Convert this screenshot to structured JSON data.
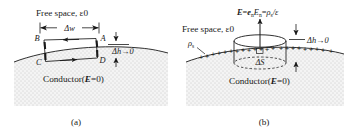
{
  "figure": {
    "title_absent": true,
    "panels": [
      {
        "id": "a",
        "caption": "(a)",
        "free_space_label": "Free space, ε0",
        "conductor_label_prefix": "Conductor(",
        "conductor_label_E": "E",
        "conductor_label_suffix": "=0)",
        "delta_w_label": "Δw",
        "delta_h_label": "Δh→0",
        "corner_labels": {
          "top_left": "B",
          "top_right": "A",
          "bottom_left": "C",
          "bottom_right": "D"
        }
      },
      {
        "id": "b",
        "caption": "(b)",
        "free_space_label": "Free space, ε0",
        "conductor_label_prefix": "Conductor(",
        "conductor_label_E": "E",
        "conductor_label_suffix": "=0)",
        "field_formula": {
          "E_bold": "E",
          "equals1": "=",
          "e_vec": "e",
          "e_sub": "n",
          "E_n": "E",
          "E_n_sub": "n",
          "equals2": "=",
          "rho": "ρ",
          "rho_sub": "s",
          "slash_eps": "/ε",
          "full": "E=enEn=ρs/ε"
        },
        "rho_s_label": "ρ",
        "rho_s_sub": "s",
        "delta_S_label": "ΔS",
        "delta_h_label": "Δh→0",
        "surface_charge_symbol": "+"
      }
    ],
    "colors": {
      "ink": "#1a1a1a",
      "background": "#ffffff",
      "conductor_fill": "#f2f2f2",
      "stipple": "#9a9a9a"
    }
  }
}
